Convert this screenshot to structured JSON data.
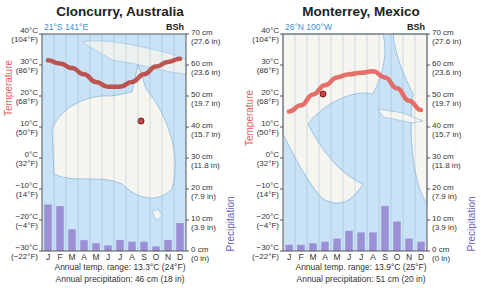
{
  "chart_data": [
    {
      "type": "bar+line",
      "title": "Cloncurry, Australia",
      "coords": "21°S 141°E",
      "climate_code": "BSh",
      "categories": [
        "J",
        "F",
        "M",
        "A",
        "M",
        "J",
        "J",
        "A",
        "S",
        "O",
        "N",
        "D"
      ],
      "series": [
        {
          "name": "Temperature (°C)",
          "type": "line",
          "color": "#d9544f",
          "values": [
            31.5,
            30.5,
            29,
            27,
            24.5,
            23,
            23,
            24.5,
            27,
            29.5,
            31,
            32
          ]
        },
        {
          "name": "Precipitation (cm)",
          "type": "bar",
          "color": "#9b8fd6",
          "values": [
            15,
            14.5,
            7,
            3.5,
            2.5,
            1.8,
            3.5,
            3,
            3,
            1.5,
            3.5,
            9
          ]
        }
      ],
      "left_axis": {
        "label": "Temperature",
        "ticks": [
          "40°C|(104°F)",
          "30°C|(86°F)",
          "20°C|(68°F)",
          "10°C|(50°F)",
          "0°C|(32°F)",
          "−10°C|(14°F)",
          "−20°C|(−4°F)",
          "−30°C|(−22°F)"
        ],
        "ylim": [
          -30,
          40
        ]
      },
      "right_axis": {
        "label": "Precipitation",
        "ticks": [
          "70 cm|(27.6 in)",
          "60 cm|(23.6 in)",
          "50 cm|(19.7 in)",
          "40 cm|(15.7 in)",
          "30 cm|(11.8 in)",
          "20 cm|(7.9 in)",
          "10 cm|(3.9 in)",
          "0 cm|(0 in)"
        ],
        "ylim": [
          0,
          70
        ]
      },
      "caption_range": "Annual temp. range: 13.3°C (24°F)",
      "caption_precip": "Annual precipitation: 46 cm (18 in)"
    },
    {
      "type": "bar+line",
      "title": "Monterrey, Mexico",
      "coords": "26°N 100°W",
      "climate_code": "BSh",
      "categories": [
        "J",
        "F",
        "M",
        "A",
        "M",
        "J",
        "J",
        "A",
        "S",
        "O",
        "N",
        "D"
      ],
      "series": [
        {
          "name": "Temperature (°C)",
          "type": "line",
          "color": "#e8645a",
          "values": [
            15,
            17,
            20.5,
            23.5,
            26,
            27,
            27.5,
            28,
            26,
            22.5,
            18.5,
            15.5
          ]
        },
        {
          "name": "Precipitation (cm)",
          "type": "bar",
          "color": "#9b8fd6",
          "values": [
            2,
            2,
            2.5,
            3,
            4,
            6.5,
            6,
            6,
            14.5,
            9.5,
            4,
            3
          ]
        }
      ],
      "left_axis": {
        "label": "Temperature",
        "ticks": [
          "40°C|(104°F)",
          "30°C|(86°F)",
          "20°C|(68°F)",
          "10°C|(50°F)",
          "0°C|(32°F)",
          "−10°C|(14°F)",
          "−20°C|(−4°F)",
          "−30°C|(−22°F)"
        ],
        "ylim": [
          -30,
          40
        ]
      },
      "right_axis": {
        "label": "Precipitation",
        "ticks": [
          "70 cm|(27.6 in)",
          "60 cm|(23.6 in)",
          "50 cm|(19.7 in)",
          "40 cm|(15.7 in)",
          "30 cm|(11.8 in)",
          "20 cm|(7.9 in)",
          "10 cm|(3.9 in)",
          "0 cm|(0 in)"
        ],
        "ylim": [
          0,
          70
        ]
      },
      "caption_range": "Annual temp. range: 13.9°C (25°F)",
      "caption_precip": "Annual precipitation: 51 cm (20 in)"
    }
  ],
  "left": {
    "title": "Cloncurry, Australia",
    "coords": "21°S 141°E",
    "code": "BSh",
    "caption_range": "Annual temp. range: 13.3°C (24°F)",
    "caption_precip": "Annual precipitation: 46 cm (18 in)"
  },
  "right": {
    "title": "Monterrey, Mexico",
    "coords": "26°N 100°W",
    "code": "BSh",
    "caption_range": "Annual temp. range: 13.9°C (25°F)",
    "caption_precip": "Annual precipitation: 51 cm (20 in)"
  },
  "colors": {
    "temp": "#d9544f",
    "precip_bar": "#9b8fd6",
    "precip_label": "#6a5fc4",
    "temp_label": "#e4605a",
    "water": "#c9e2f5",
    "land": "#f7f5ef",
    "coords": "#3b8fd0"
  }
}
